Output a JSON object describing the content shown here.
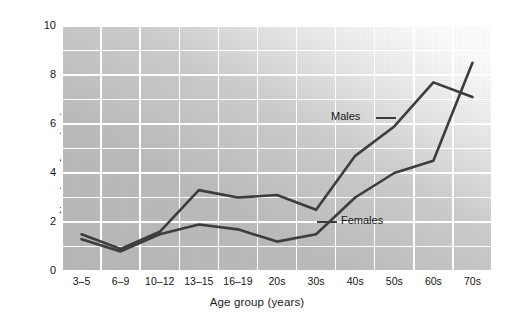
{
  "chart_data": {
    "type": "line",
    "title": "",
    "xlabel": "Age group (years)",
    "ylabel": "Number of awakenings",
    "categories": [
      "3–5",
      "6–9",
      "10–12",
      "13–15",
      "16–19",
      "20s",
      "30s",
      "40s",
      "50s",
      "60s",
      "70s"
    ],
    "ylim": [
      0,
      10
    ],
    "y_ticks": [
      "0",
      "2",
      "4",
      "6",
      "8",
      "10"
    ],
    "y_tick_values": [
      0,
      2,
      4,
      6,
      8,
      10
    ],
    "grid": "horizontal and vertical white gridlines at every 1 unit (y) and every category (x)",
    "legend_position": "inline annotations next to each line",
    "series": [
      {
        "name": "Males",
        "values": [
          1.5,
          0.9,
          1.6,
          3.3,
          3.0,
          3.1,
          2.5,
          4.7,
          5.9,
          7.7,
          7.1
        ],
        "color": "#3d3d3d"
      },
      {
        "name": "Females",
        "values": [
          1.3,
          0.8,
          1.5,
          1.9,
          1.7,
          1.2,
          1.5,
          3.0,
          4.0,
          4.5,
          8.5
        ],
        "color": "#3d3d3d"
      }
    ],
    "annotations": [
      {
        "text": "Males",
        "points_to": "males-line"
      },
      {
        "text": "Females",
        "points_to": "females-line"
      }
    ]
  },
  "colors": {
    "plot_background": "#b9b9b9",
    "gridline": "#ffffff",
    "line": "#3d3d3d",
    "text": "#151515"
  }
}
